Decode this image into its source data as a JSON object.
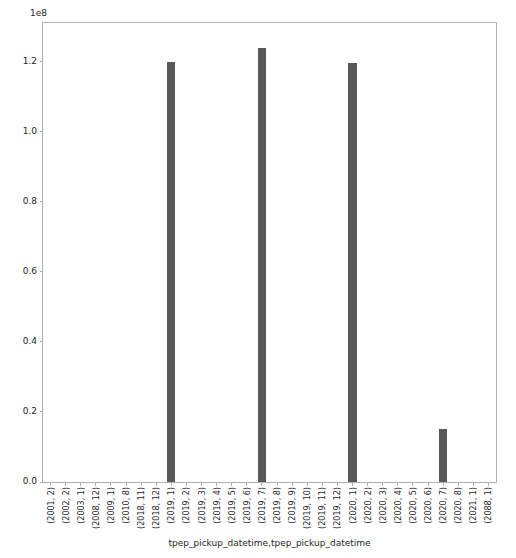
{
  "chart_data": {
    "type": "bar",
    "title": "",
    "xlabel": "tpep_pickup_datetime,tpep_pickup_datetime",
    "ylabel": "",
    "y_offset_text": "1e8",
    "y_scale": 100000000,
    "ylim": [
      0,
      131000000
    ],
    "grid": false,
    "legend": null,
    "bar_color": "#595959",
    "categories": [
      "(2001, 2)",
      "(2002, 2)",
      "(2003, 1)",
      "(2008, 12)",
      "(2009, 1)",
      "(2010, 8)",
      "(2018, 11)",
      "(2018, 12)",
      "(2019, 1)",
      "(2019, 2)",
      "(2019, 3)",
      "(2019, 4)",
      "(2019, 5)",
      "(2019, 6)",
      "(2019, 7)",
      "(2019, 8)",
      "(2019, 9)",
      "(2019, 10)",
      "(2019, 11)",
      "(2019, 12)",
      "(2020, 1)",
      "(2020, 2)",
      "(2020, 3)",
      "(2020, 4)",
      "(2020, 5)",
      "(2020, 6)",
      "(2020, 7)",
      "(2020, 8)",
      "(2021, 1)",
      "(2088, 1)"
    ],
    "values": [
      0,
      0,
      0,
      0,
      0,
      0,
      0,
      0,
      120000000,
      0,
      0,
      0,
      0,
      0,
      124000000,
      0,
      0,
      0,
      0,
      0,
      119500000,
      0,
      0,
      0,
      0,
      0,
      15000000,
      0,
      0,
      0
    ],
    "ytick_values": [
      0,
      20000000,
      40000000,
      60000000,
      80000000,
      100000000,
      120000000
    ],
    "ytick_labels": [
      "0.0",
      "0.2",
      "0.4",
      "0.6",
      "0.8",
      "1.0",
      "1.2"
    ]
  }
}
